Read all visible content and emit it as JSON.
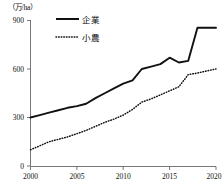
{
  "chart_data": {
    "type": "line",
    "title": "",
    "unit_label": "（万/ha）",
    "xlabel": "",
    "ylabel": "",
    "xlim": [
      2000,
      2020
    ],
    "ylim": [
      0,
      900
    ],
    "yticks": [
      0,
      300,
      600,
      900
    ],
    "ytick_labels": [
      "0",
      "300",
      "600",
      "900"
    ],
    "xticks": [
      2000,
      2005,
      2010,
      2015,
      2020
    ],
    "xtick_labels": [
      "2000",
      "2005",
      "2010",
      "2015",
      "2020"
    ],
    "grid": false,
    "legend_position": "top-left-inside",
    "x": [
      2000,
      2001,
      2002,
      2003,
      2004,
      2005,
      2006,
      2007,
      2008,
      2009,
      2010,
      2011,
      2012,
      2013,
      2014,
      2015,
      2016,
      2017,
      2018,
      2019,
      2020
    ],
    "series": [
      {
        "name": "企業",
        "style": "solid",
        "color": "#111111",
        "values": [
          300,
          315,
          330,
          345,
          360,
          370,
          385,
          420,
          450,
          480,
          510,
          530,
          600,
          615,
          630,
          670,
          640,
          650,
          855,
          855,
          855
        ]
      },
      {
        "name": "小農",
        "style": "dotted",
        "color": "#111111",
        "values": [
          100,
          125,
          150,
          165,
          180,
          200,
          220,
          245,
          270,
          290,
          315,
          350,
          395,
          415,
          440,
          465,
          490,
          565,
          575,
          588,
          600
        ]
      }
    ]
  },
  "legend": {
    "entries": [
      {
        "label": "企業"
      },
      {
        "label": "小農"
      }
    ]
  },
  "axes": {
    "y_unit": "（万/ha）"
  }
}
